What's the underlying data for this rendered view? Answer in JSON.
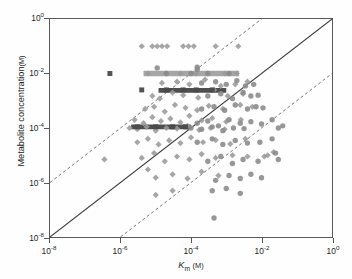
{
  "chart_data": {
    "type": "scatter",
    "title": "",
    "xlabel": "Km (M)",
    "ylabel": "Metabolite concentration (M)",
    "xlabel_parts": {
      "italic": "K",
      "subscript": "m",
      "unit": "(M)"
    },
    "ylabel_parts": {
      "text": "Metabolite concentration",
      "unit": "(M)"
    },
    "xscale": "log",
    "yscale": "log",
    "xlim": [
      1e-08,
      1.0
    ],
    "ylim": [
      1e-08,
      1.0
    ],
    "grid": false,
    "legend": null,
    "xticks": [
      {
        "value": 1e-08,
        "label": "10",
        "exp": "-8"
      },
      {
        "value": 1e-06,
        "label": "10",
        "exp": "-6"
      },
      {
        "value": 0.0001,
        "label": "10",
        "exp": "-4"
      },
      {
        "value": 0.01,
        "label": "10",
        "exp": "-2"
      },
      {
        "value": 1.0,
        "label": "10",
        "exp": "0"
      }
    ],
    "yticks": [
      {
        "value": 1.0,
        "label": "10",
        "exp": "0"
      },
      {
        "value": 0.01,
        "label": "10",
        "exp": "-2"
      },
      {
        "value": 0.0001,
        "label": "10",
        "exp": "-4"
      },
      {
        "value": 1e-06,
        "label": "10",
        "exp": "-6"
      },
      {
        "value": 1e-08,
        "label": "10",
        "exp": "-8"
      }
    ],
    "reference_lines": [
      {
        "name": "identity",
        "style": "solid",
        "color": "#3c3c3c",
        "intercept_decades": 0,
        "desc": "y = x"
      },
      {
        "name": "upper-bound",
        "style": "dashed",
        "color": "#6f6f6f",
        "intercept_decades": 2,
        "desc": "y = 100x"
      },
      {
        "name": "lower-bound",
        "style": "dashed",
        "color": "#6f6f6f",
        "intercept_decades": -2,
        "desc": "y = 0.01x"
      }
    ],
    "marker_styles": {
      "diamond": {
        "color": "#9a9a9a",
        "size": 5.6,
        "opacity": 0.88
      },
      "circle": {
        "color": "#8c8c8c",
        "size": 5.4,
        "opacity": 0.9
      },
      "square": {
        "color": "#4a4a4a",
        "size": 5.0,
        "opacity": 0.95
      }
    },
    "bands": [
      {
        "name": "band-1e-2",
        "y": 0.01,
        "x_start": 4.5e-06,
        "x_end": 0.0023,
        "color": "#9e9e9e",
        "height_px": 5.5
      },
      {
        "name": "band-2.5e-3",
        "y": 0.0024,
        "x_start": 1.2e-05,
        "x_end": 0.001,
        "color": "#3f3f3f",
        "height_px": 5.0
      },
      {
        "name": "band-1e-4",
        "y": 0.00011,
        "x_start": 2e-06,
        "x_end": 0.0001,
        "color": "#3f3f3f",
        "height_px": 5.0
      }
    ],
    "series": [
      {
        "name": "diamonds",
        "marker": "diamond",
        "points": [
          [
            4e-06,
            0.1
          ],
          [
            8e-06,
            0.1
          ],
          [
            1.1e-05,
            0.1
          ],
          [
            1.5e-05,
            0.1
          ],
          [
            2.1e-05,
            0.1
          ],
          [
            6e-05,
            0.1
          ],
          [
            8.5e-05,
            0.1
          ],
          [
            0.00012,
            0.1
          ],
          [
            0.0005,
            0.1
          ],
          [
            0.0022,
            0.1
          ],
          [
            6e-06,
            0.01
          ],
          [
            2e-05,
            0.01
          ],
          [
            5e-05,
            0.01
          ],
          [
            0.00014,
            0.01
          ],
          [
            0.0003,
            0.01
          ],
          [
            0.0009,
            0.01
          ],
          [
            0.002,
            0.01
          ],
          [
            1.5e-05,
            0.0045
          ],
          [
            4e-05,
            0.005
          ],
          [
            9e-05,
            0.004
          ],
          [
            0.00025,
            0.006
          ],
          [
            0.0007,
            0.0035
          ],
          [
            0.0018,
            0.004
          ],
          [
            0.004,
            0.005
          ],
          [
            8e-06,
            0.0015
          ],
          [
            1.3e-05,
            0.0012
          ],
          [
            3e-05,
            0.002
          ],
          [
            6e-05,
            0.0016
          ],
          [
            0.00016,
            0.0013
          ],
          [
            0.00045,
            0.0025
          ],
          [
            0.0011,
            0.0015
          ],
          [
            0.003,
            0.0018
          ],
          [
            5e-06,
            0.0005
          ],
          [
            9e-06,
            0.0006
          ],
          [
            1.8e-05,
            0.0004
          ],
          [
            3.5e-05,
            0.0007
          ],
          [
            7e-05,
            0.00055
          ],
          [
            0.00015,
            0.00045
          ],
          [
            0.00032,
            0.00065
          ],
          [
            0.0008,
            0.0005
          ],
          [
            0.0025,
            0.0007
          ],
          [
            0.0055,
            0.0006
          ],
          [
            2.5e-06,
            0.0002
          ],
          [
            4.5e-06,
            0.00015
          ],
          [
            8e-06,
            0.00025
          ],
          [
            1.4e-05,
            0.00018
          ],
          [
            2.6e-05,
            0.00022
          ],
          [
            5e-05,
            0.00016
          ],
          [
            9e-05,
            0.00028
          ],
          [
            0.0002,
            0.00019
          ],
          [
            0.0004,
            0.00023
          ],
          [
            0.001,
            0.00017
          ],
          [
            0.0026,
            0.0002
          ],
          [
            1.8e-06,
            0.0001
          ],
          [
            3e-06,
            9e-05
          ],
          [
            5.5e-06,
            0.00011
          ],
          [
            1e-05,
            8e-05
          ],
          [
            2e-05,
            0.0001
          ],
          [
            4e-05,
            9.5e-05
          ],
          [
            8e-05,
            0.00012
          ],
          [
            0.00017,
            8.5e-05
          ],
          [
            0.00036,
            0.0001
          ],
          [
            0.0009,
            9e-05
          ],
          [
            3e-06,
            3e-05
          ],
          [
            6e-06,
            4e-05
          ],
          [
            1.2e-05,
            2.5e-05
          ],
          [
            2.4e-05,
            3.5e-05
          ],
          [
            5e-05,
            2.8e-05
          ],
          [
            0.0001,
            4.5e-05
          ],
          [
            0.00022,
            3e-05
          ],
          [
            0.0005,
            3.6e-05
          ],
          [
            0.0013,
            2.6e-05
          ],
          [
            0.0035,
            4e-05
          ],
          [
            4e-06,
            8e-06
          ],
          [
            9e-06,
            1.2e-05
          ],
          [
            1.8e-05,
            6e-06
          ],
          [
            4e-05,
            9e-06
          ],
          [
            9e-05,
            7e-06
          ],
          [
            0.0002,
            1.1e-05
          ],
          [
            0.0005,
            8e-06
          ],
          [
            0.0015,
            1e-05
          ],
          [
            0.004,
            9e-06
          ],
          [
            0.012,
            9e-06
          ],
          [
            1e-05,
            1.5e-06
          ],
          [
            3e-05,
            2e-06
          ],
          [
            8e-05,
            1.4e-06
          ],
          [
            0.0002,
            2.5e-06
          ],
          [
            0.0006,
            1.8e-06
          ],
          [
            3.5e-07,
            7e-06
          ],
          [
            6e-06,
            3e-06
          ],
          [
            1e-05,
            3.5e-07
          ],
          [
            3e-05,
            5e-07
          ],
          [
            0.015,
            1e-05
          ],
          [
            0.022,
            1.3e-05
          ]
        ]
      },
      {
        "name": "circles",
        "marker": "circle",
        "points": [
          [
            1.1e-05,
            0.016
          ],
          [
            0.00015,
            0.017
          ],
          [
            0.00015,
            0.014
          ],
          [
            2e-05,
            0.01
          ],
          [
            0.0001,
            0.01
          ],
          [
            0.0003,
            0.01
          ],
          [
            0.0012,
            0.01
          ],
          [
            0.0002,
            0.0045
          ],
          [
            0.0005,
            0.005
          ],
          [
            0.001,
            0.004
          ],
          [
            0.002,
            0.0055
          ],
          [
            0.0035,
            0.0035
          ],
          [
            0.006,
            0.004
          ],
          [
            0.0003,
            0.0015
          ],
          [
            0.0007,
            0.0018
          ],
          [
            0.0015,
            0.0012
          ],
          [
            0.003,
            0.002
          ],
          [
            0.005,
            0.0015
          ],
          [
            0.008,
            0.0016
          ],
          [
            0.0002,
            0.0005
          ],
          [
            0.00045,
            0.0006
          ],
          [
            0.0009,
            0.00045
          ],
          [
            0.0018,
            0.0007
          ],
          [
            0.004,
            0.0005
          ],
          [
            0.007,
            0.0006
          ],
          [
            0.011,
            0.00055
          ],
          [
            0.00015,
            0.00015
          ],
          [
            0.0003,
            0.00018
          ],
          [
            0.0006,
            0.00012
          ],
          [
            0.0012,
            0.0002
          ],
          [
            0.0025,
            0.00015
          ],
          [
            0.005,
            0.00017
          ],
          [
            0.01,
            0.00014
          ],
          [
            0.0001,
            0.0001
          ],
          [
            0.0002,
            9e-05
          ],
          [
            0.0004,
            0.00011
          ],
          [
            0.0008,
            8e-05
          ],
          [
            0.0016,
            0.0001
          ],
          [
            0.0032,
            9.5e-05
          ],
          [
            0.00015,
            3e-05
          ],
          [
            0.0004,
            4e-05
          ],
          [
            0.0008,
            2.5e-05
          ],
          [
            0.0018,
            3.5e-05
          ],
          [
            0.004,
            2.8e-05
          ],
          [
            0.009,
            3e-05
          ],
          [
            0.02,
            4e-05
          ],
          [
            0.0003,
            6e-06
          ],
          [
            0.0007,
            9e-06
          ],
          [
            0.0015,
            5e-06
          ],
          [
            0.003,
            7e-06
          ],
          [
            0.008,
            6e-06
          ],
          [
            0.025,
            1.2e-05
          ],
          [
            0.03,
            7e-06
          ],
          [
            0.0005,
            1.2e-06
          ],
          [
            0.0012,
            1.8e-06
          ],
          [
            0.0025,
            1.4e-06
          ],
          [
            0.005,
            2e-06
          ],
          [
            0.01,
            1.5e-06
          ],
          [
            0.0004,
            5e-07
          ],
          [
            0.001,
            6e-07
          ],
          [
            0.0025,
            4e-07
          ],
          [
            0.00045,
            5e-08
          ],
          [
            0.02,
            0.0002
          ],
          [
            0.03,
            0.0001
          ],
          [
            0.04,
            0.00012
          ]
        ]
      },
      {
        "name": "squares",
        "marker": "square",
        "points": [
          [
            5e-07,
            0.01
          ],
          [
            4e-06,
            0.0025
          ],
          [
            2e-05,
            0.0025
          ],
          [
            6e-05,
            0.0025
          ],
          [
            0.00014,
            0.0025
          ],
          [
            0.0004,
            0.0025
          ],
          [
            3e-06,
            0.00011
          ],
          [
            1e-05,
            0.00011
          ],
          [
            3e-05,
            0.00011
          ],
          [
            7e-05,
            0.00011
          ]
        ]
      }
    ]
  }
}
